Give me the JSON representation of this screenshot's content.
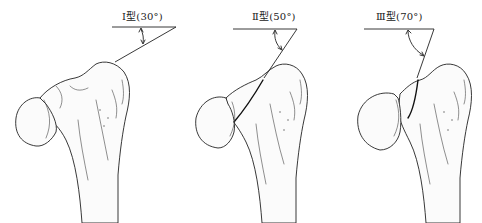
{
  "figure": {
    "panels": [
      {
        "id": "type-1",
        "label": "Ⅰ型(30°)",
        "roman": "Ⅰ",
        "type_char": "型",
        "angle_deg": 30,
        "angle_text": "(30°)"
      },
      {
        "id": "type-2",
        "label": "Ⅱ型(50°)",
        "roman": "Ⅱ",
        "type_char": "型",
        "angle_deg": 50,
        "angle_text": "(50°)"
      },
      {
        "id": "type-3",
        "label": "Ⅲ型(70°)",
        "roman": "Ⅲ",
        "type_char": "型",
        "angle_deg": 70,
        "angle_text": "(70°)"
      }
    ]
  },
  "colors": {
    "background": "#ffffff",
    "line": "#222222",
    "bone_fill": "#fbfbfb"
  }
}
